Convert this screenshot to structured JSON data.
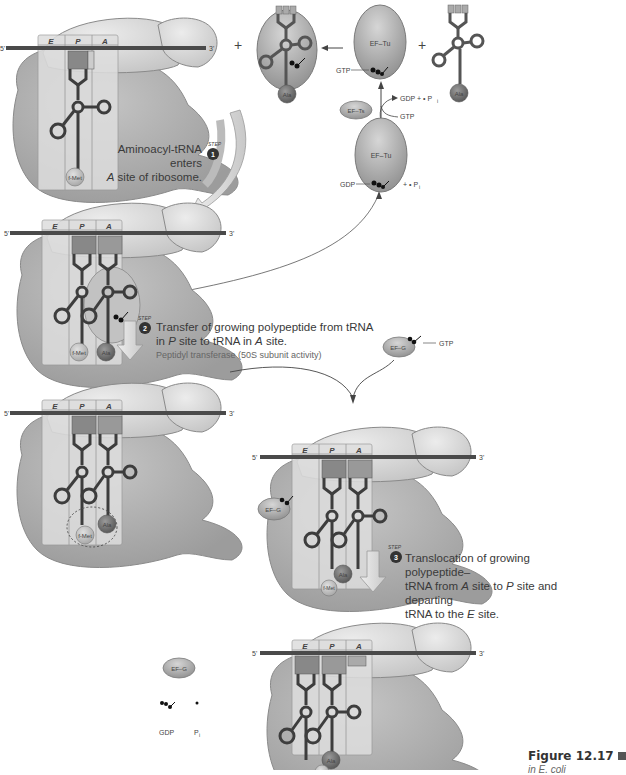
{
  "figure": {
    "label": "Figure 12.17",
    "sublabel": "in E. coli"
  },
  "ribosome": {
    "sites": [
      "E",
      "P",
      "A"
    ],
    "mrna_5": "5'",
    "mrna_3": "3'"
  },
  "molecules": {
    "fmet": "f-Met",
    "ala": "Ala",
    "ef_tu": "EF–Tu",
    "ef_ts": "EF–Ts",
    "ef_g": "EF–G",
    "gtp": "GTP",
    "gdp": "GDP",
    "pi": "P",
    "pi_sub": "i",
    "plus": "+"
  },
  "ef_cycle": {
    "gdp_plus_pi": "GDP + • P",
    "plus_pi": "+ • P"
  },
  "steps": [
    {
      "number": "1",
      "step_word": "STEP",
      "text_line1": "Aminoacyl-tRNA enters",
      "text_line2_italic": "A",
      "text_line2_rest": " site of ribosome."
    },
    {
      "number": "2",
      "step_word": "STEP",
      "text_line1": "Transfer of growing polypeptide from tRNA",
      "text_line2_a": "in ",
      "text_line2_p": "P",
      "text_line2_b": " site to tRNA in ",
      "text_line2_a2": "A",
      "text_line2_c": " site.",
      "sub": "Peptidyl transferase (50S subunit activity)"
    },
    {
      "number": "3",
      "step_word": "STEP",
      "text_line1": "Translocation of growing polypeptide–",
      "text_line2_a": "tRNA from ",
      "text_line2_A": "A",
      "text_line2_b": " site to ",
      "text_line2_P": "P",
      "text_line2_c": " site and departing",
      "text_line3_a": "tRNA to the ",
      "text_line3_E": "E",
      "text_line3_b": " site."
    }
  ],
  "released": {
    "ef_g": "EF–G",
    "gdp": "GDP",
    "pi": "P",
    "pi_sub": "i"
  },
  "colors": {
    "ribosome_large": "#b3b3b3",
    "ribosome_small": "#d6d6d6",
    "site_box": "#e4e4e4",
    "mrna": "#4a4a4a",
    "trna": "#3d3d3d",
    "ef_oval": "#a9a9a9",
    "arrow_fill": "#d8d8d8"
  }
}
